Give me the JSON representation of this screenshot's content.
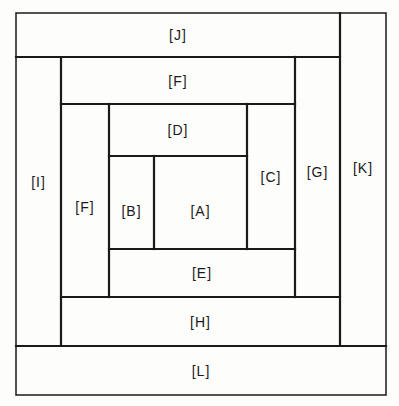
{
  "diagram": {
    "type": "log-cabin quilt block layout",
    "line_color": "#1a1a1a",
    "background": "#fdfdfb",
    "blocks": [
      {
        "id": "J",
        "label": "[J]",
        "x": 16,
        "y": 13,
        "w": 324,
        "h": 44
      },
      {
        "id": "K",
        "label": "[K]",
        "x": 340,
        "y": 13,
        "w": 46,
        "h": 333
      },
      {
        "id": "I",
        "label": "[I]",
        "x": 16,
        "y": 57,
        "w": 45,
        "h": 289
      },
      {
        "id": "F_top",
        "label": "[F]",
        "x": 61,
        "y": 57,
        "w": 234,
        "h": 47
      },
      {
        "id": "G",
        "label": "[G]",
        "x": 295,
        "y": 57,
        "w": 45,
        "h": 240
      },
      {
        "id": "F_left",
        "label": "[F]",
        "x": 61,
        "y": 104,
        "w": 48,
        "h": 193
      },
      {
        "id": "D",
        "label": "[D]",
        "x": 109,
        "y": 104,
        "w": 138,
        "h": 52
      },
      {
        "id": "C",
        "label": "[C]",
        "x": 247,
        "y": 104,
        "w": 48,
        "h": 145
      },
      {
        "id": "B",
        "label": "[B]",
        "x": 109,
        "y": 156,
        "w": 45,
        "h": 93
      },
      {
        "id": "A",
        "label": "[A]",
        "x": 154,
        "y": 156,
        "w": 93,
        "h": 93
      },
      {
        "id": "E",
        "label": "[E]",
        "x": 109,
        "y": 249,
        "w": 186,
        "h": 48
      },
      {
        "id": "H",
        "label": "[H]",
        "x": 61,
        "y": 297,
        "w": 279,
        "h": 49
      },
      {
        "id": "L",
        "label": "[L]",
        "x": 16,
        "y": 346,
        "w": 370,
        "h": 49
      }
    ],
    "labels": {
      "J": "[J]",
      "K": "[K]",
      "I": "[I]",
      "F_top": "[F]",
      "G": "[G]",
      "F_left": "[F]",
      "D": "[D]",
      "C": "[C]",
      "B": "[B]",
      "A": "[A]",
      "E": "[E]",
      "H": "[H]",
      "L": "[L]"
    }
  }
}
